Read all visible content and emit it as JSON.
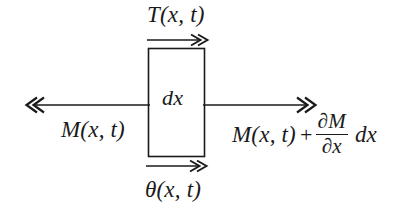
{
  "figure": {
    "type": "free-body-diagram",
    "background_color": "#ffffff",
    "stroke_color": "#1a1a1a",
    "element_box": {
      "label": "dx",
      "x": 148,
      "y": 48,
      "width": 57,
      "height": 109
    },
    "labels": {
      "top": "T(x, t)",
      "bottom": "θ(x, t)",
      "inside": "dx",
      "left": "M(x, t)",
      "right_term": "M(x, t)",
      "right_operator": "+",
      "right_fraction_numerator": "∂M",
      "right_fraction_denominator": "∂x",
      "right_tail": "dx"
    },
    "arrows": [
      {
        "name": "top-shear-arrow",
        "label": "T(x, t)",
        "direction": "right",
        "heads": 2,
        "x1": 147,
        "x2": 207,
        "y": 40
      },
      {
        "name": "bottom-rotation-arrow",
        "label": "θ(x, t)",
        "direction": "right",
        "heads": 2,
        "x1": 146,
        "x2": 206,
        "y": 166
      },
      {
        "name": "left-moment-arrow",
        "label": "M(x, t)",
        "direction": "left",
        "heads": 2,
        "x1": 148,
        "x2": 28,
        "y": 105
      },
      {
        "name": "right-moment-arrow",
        "label": "M(x, t) + ∂M/∂x dx",
        "direction": "right",
        "heads": 2,
        "x1": 205,
        "x2": 318,
        "y": 105
      }
    ]
  }
}
